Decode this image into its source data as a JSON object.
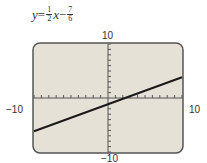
{
  "equation": {
    "y": "y",
    "eq": " = ",
    "m_num": "1",
    "m_den": "2",
    "x": "x",
    "minus": " − ",
    "b_num": "7",
    "b_den": "6"
  },
  "axis_labels": {
    "ymax": "10",
    "ymin": "−10",
    "xmin": "−10",
    "xmax": "10"
  },
  "colors": {
    "screen_bg": "#e6e1d6",
    "border": "#555555",
    "line": "#1a1a1a"
  },
  "chart_data": {
    "type": "line",
    "xlabel": "",
    "ylabel": "",
    "xlim": [
      -10,
      10
    ],
    "ylim": [
      -10,
      10
    ],
    "xticks_step": 1,
    "yticks_step": 1,
    "grid": false,
    "series": [
      {
        "name": "y = 1/2 x − 7/6",
        "x": [
          -10,
          10
        ],
        "y": [
          -6.1667,
          3.8333
        ]
      }
    ]
  }
}
